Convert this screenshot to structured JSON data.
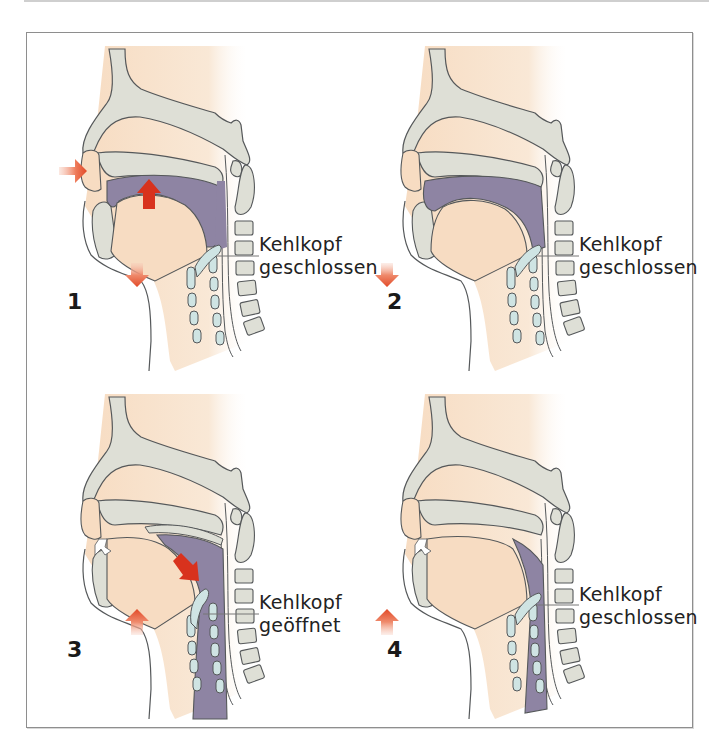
{
  "figure": {
    "colors": {
      "skin": "#f7dfc6",
      "bone": "#dedfd6",
      "outline": "#55585a",
      "cavity_purple": "#8e84a3",
      "cartilage_blue": "#cfe4e3",
      "arrow_red": "#d8321d",
      "arrow_orange": "#e8684a",
      "frame_border": "#8e8e8e"
    },
    "panels": [
      {
        "number": "1",
        "label_line1": "Kehlkopf",
        "label_line2": "geschlossen",
        "arrows": [
          "right-arrow-air-inflow",
          "up-arrow-tongue",
          "down-arrow-jaw"
        ]
      },
      {
        "number": "2",
        "label_line1": "Kehlkopf",
        "label_line2": "geschlossen",
        "arrows": [
          "down-arrow-jaw"
        ]
      },
      {
        "number": "3",
        "label_line1": "Kehlkopf",
        "label_line2": "geöffnet",
        "arrows": [
          "diagonal-down-arrow-pharynx",
          "up-arrow-jaw"
        ]
      },
      {
        "number": "4",
        "label_line1": "Kehlkopf",
        "label_line2": "geschlossen",
        "arrows": [
          "up-arrow-jaw"
        ]
      }
    ]
  }
}
